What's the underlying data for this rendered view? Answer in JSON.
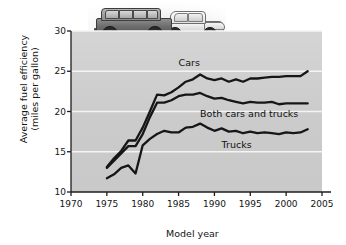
{
  "figure": {
    "photo_caption_alt": "station wagon and sedan photo",
    "photo_vehicles": [
      "station-wagon",
      "sedan"
    ]
  },
  "chart_data": {
    "type": "line",
    "title": "",
    "xlabel": "Model year",
    "ylabel": "Average fuel efficiency (miles per gallon)",
    "ylabel_line1": "Average fuel efficiency",
    "ylabel_line2": "(miles per gallon)",
    "xlim": [
      1970,
      2005
    ],
    "ylim": [
      10,
      30
    ],
    "xticks": [
      1970,
      1975,
      1980,
      1985,
      1990,
      1995,
      2000,
      2005
    ],
    "yticks": [
      10,
      15,
      20,
      25,
      30
    ],
    "grid": "horizontal-white",
    "legend": "inline-annotations",
    "plot_bg": "#c9c9c9",
    "line_color": "#161616",
    "x": [
      1975,
      1976,
      1977,
      1978,
      1979,
      1980,
      1981,
      1982,
      1983,
      1984,
      1985,
      1986,
      1987,
      1988,
      1989,
      1990,
      1991,
      1992,
      1993,
      1994,
      1995,
      1996,
      1997,
      1998,
      1999,
      2000,
      2001,
      2002,
      2003
    ],
    "series": [
      {
        "name": "Cars",
        "values": [
          13.1,
          14.2,
          15.1,
          16.4,
          16.4,
          18.0,
          20.0,
          22.1,
          22.0,
          22.4,
          23.0,
          23.7,
          24.0,
          24.6,
          24.1,
          23.9,
          24.1,
          23.7,
          24.0,
          23.7,
          24.1,
          24.1,
          24.2,
          24.3,
          24.3,
          24.4,
          24.4,
          24.4,
          25.0
        ]
      },
      {
        "name": "Both cars and trucks",
        "values": [
          13.0,
          13.9,
          14.8,
          15.7,
          15.7,
          17.2,
          19.3,
          21.1,
          21.1,
          21.4,
          21.9,
          22.1,
          22.1,
          22.3,
          21.9,
          21.6,
          21.7,
          21.4,
          21.2,
          21.0,
          21.2,
          21.1,
          21.1,
          21.2,
          20.9,
          21.0,
          21.0,
          21.0,
          21.0
        ]
      },
      {
        "name": "Trucks",
        "values": [
          11.7,
          12.2,
          13.0,
          13.3,
          12.3,
          15.8,
          16.6,
          17.2,
          17.6,
          17.4,
          17.4,
          18.0,
          18.1,
          18.5,
          18.0,
          17.6,
          17.9,
          17.5,
          17.6,
          17.3,
          17.5,
          17.3,
          17.4,
          17.3,
          17.2,
          17.4,
          17.3,
          17.4,
          17.8
        ]
      }
    ],
    "annotations": [
      {
        "text": "Cars",
        "x": 1985,
        "y": 26.0
      },
      {
        "text": "Both cars and trucks",
        "x": 1988,
        "y": 19.7
      },
      {
        "text": "Trucks",
        "x": 1991,
        "y": 15.9
      }
    ]
  }
}
